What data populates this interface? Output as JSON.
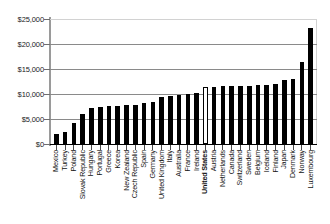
{
  "chart_data": {
    "type": "bar",
    "title": "",
    "subtitle": "",
    "xlabel": "",
    "ylabel": "",
    "ylim": [
      0,
      25000
    ],
    "ytick_values": [
      0,
      5000,
      10000,
      15000,
      20000,
      25000
    ],
    "ytick_labels": [
      "$0",
      "$5,000",
      "$10,000",
      "$15,000",
      "$20,000",
      "$25,000"
    ],
    "grid": "horizontal",
    "legend": "none",
    "orientation": "vertical",
    "xtick_label_rotation": 90,
    "series_name": "",
    "bar_color": "#000000",
    "highlight_color": "#ffffff",
    "highlight_category": "United States",
    "categories": [
      "Mexico",
      "Turkey",
      "Poland",
      "Slovak Republic",
      "Hungary",
      "Portugal",
      "Greece",
      "Korea",
      "New Zealand",
      "Czech Republic",
      "Spain",
      "Germany",
      "United Kingdom",
      "Italy",
      "Australia",
      "France",
      "Ireland",
      "United States",
      "Austria",
      "Netherlands",
      "Canada",
      "Switzerland",
      "Sweden",
      "Belgium",
      "Iceland",
      "Finland",
      "Japan",
      "Denmark",
      "Norway",
      "Luxembourg"
    ],
    "values": [
      2000,
      2400,
      4200,
      6000,
      7200,
      7400,
      7600,
      7700,
      7800,
      7800,
      8200,
      8400,
      9400,
      9700,
      9900,
      10100,
      10300,
      11400,
      11500,
      11600,
      11600,
      11700,
      11700,
      11800,
      11800,
      12000,
      12800,
      13000,
      16500,
      23200
    ]
  }
}
